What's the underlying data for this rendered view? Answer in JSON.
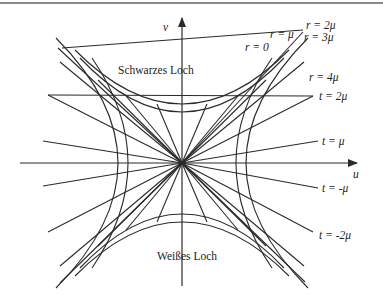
{
  "figure": {
    "axes": {
      "u_label": "u",
      "v_label": "v"
    },
    "regions": {
      "black_hole": "Schwarzes Loch",
      "white_hole": "Weißes Loch"
    },
    "r_labels": {
      "r0": "r = 0",
      "r1": "r = μ",
      "r2": "r = 2μ",
      "r3": "r = 3μ",
      "r4": "r = 4μ"
    },
    "t_labels": {
      "t2": "t = 2μ",
      "t1": "t = μ",
      "tm1": "t = -μ",
      "tm2": "t = -2μ"
    },
    "colors": {
      "line": "#2a2a2a",
      "text": "#222222",
      "background": "#ffffff",
      "top_border": "#8a8a8a"
    }
  }
}
